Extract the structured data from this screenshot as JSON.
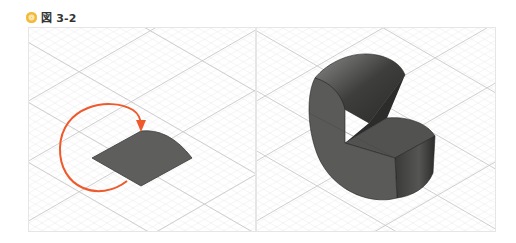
{
  "figure": {
    "label": "図 3-2",
    "icon": "figure-marker-icon",
    "accent_color": "#f4b93a"
  },
  "panels": [
    {
      "id": "left",
      "description": "Quarter-circle sector profile on isometric grid with revolve arrow",
      "shape_color": "#5e5e5c",
      "arrow_color": "#ee5a2c"
    },
    {
      "id": "right",
      "description": "Revolved solid: cylinder with quarter wedge removed",
      "shape_color": "#5a5a58"
    }
  ],
  "grid": {
    "minor_color": "#eeeeee",
    "major_color": "#c8c8c8"
  }
}
